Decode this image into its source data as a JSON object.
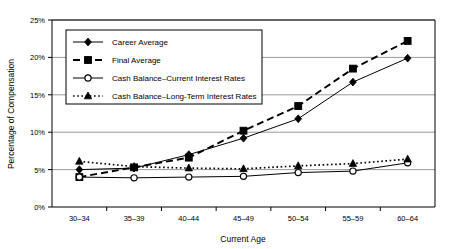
{
  "chart_data": {
    "type": "line",
    "title": "",
    "xlabel": "Current Age",
    "ylabel": "Percentage of Compensation",
    "categories": [
      "30–34",
      "35–39",
      "40–44",
      "45–49",
      "50–54",
      "55–59",
      "60–64"
    ],
    "ylim": [
      0,
      25
    ],
    "ytick_labels": [
      "0%",
      "5%",
      "10%",
      "15%",
      "20%",
      "25%"
    ],
    "ytick_values": [
      0,
      5,
      10,
      15,
      20,
      25
    ],
    "grid": "horizontal",
    "legend_position": "upper-left-inside",
    "series": [
      {
        "name": "Career Average",
        "marker": "diamond",
        "line": "solid",
        "values": [
          5.0,
          5.2,
          7.0,
          9.2,
          11.8,
          16.7,
          19.9
        ]
      },
      {
        "name": "Final Average",
        "marker": "square",
        "line": "dashed",
        "values": [
          4.0,
          5.3,
          6.6,
          10.2,
          13.5,
          18.5,
          22.2
        ]
      },
      {
        "name": "Cash Balance–Current Interest Rates",
        "marker": "circle",
        "line": "solid",
        "values": [
          4.0,
          3.9,
          4.0,
          4.1,
          4.6,
          4.8,
          5.9
        ]
      },
      {
        "name": "Cash Balance–Long-Term Interest Rates",
        "marker": "triangle",
        "line": "dotted",
        "values": [
          6.1,
          5.4,
          5.2,
          5.1,
          5.5,
          5.8,
          6.4
        ]
      }
    ]
  },
  "colors": {
    "ink": "#000000",
    "grid": "#808080",
    "axis": "#000000",
    "background": "#ffffff"
  }
}
